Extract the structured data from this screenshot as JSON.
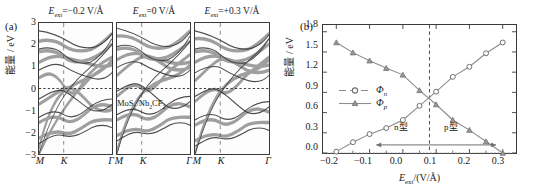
{
  "figure": {
    "panel_a_tag": "(a)",
    "panel_b_tag": "(b)"
  },
  "panel_a": {
    "ylabel": "能量 / eV",
    "yticks": [
      "3",
      "2",
      "1",
      "0",
      "−1",
      "−2",
      "−3"
    ],
    "ytick_values": [
      3,
      2,
      1,
      0,
      -1,
      -2,
      -3
    ],
    "ylim": [
      -3,
      3
    ],
    "kpath": [
      "M",
      "K",
      "Γ"
    ],
    "material_label": "MoS₂/Nb₂CF₂",
    "subpanels": [
      {
        "title": "E_ext=−0.2 V/Å",
        "field": -0.2
      },
      {
        "title": "E_ext=0 V/Å",
        "field": 0
      },
      {
        "title": "E_ext=+0.3 V/Å",
        "field": 0.3
      }
    ]
  },
  "chart_data": {
    "type": "line",
    "title": "",
    "xlabel": "E_ext/(V/Å)",
    "ylabel": "能量 / eV",
    "xlim": [
      -0.24,
      0.34
    ],
    "ylim": [
      0.0,
      1.9
    ],
    "xticks": [
      -0.2,
      -0.1,
      0.0,
      0.1,
      0.2,
      0.3
    ],
    "xtick_labels": [
      "−0.2",
      "−0.1",
      "0.0",
      "0.1",
      "0.2",
      "0.3"
    ],
    "yticks": [
      0.0,
      0.3,
      0.6,
      0.9,
      1.2,
      1.5,
      1.8
    ],
    "ytick_labels": [
      "0.0",
      "0.3",
      "0.6",
      "0.9",
      "1.2",
      "1.5",
      "1.8"
    ],
    "grid": false,
    "legend_position": "center-left",
    "x": [
      -0.2,
      -0.15,
      -0.1,
      -0.05,
      0.0,
      0.05,
      0.1,
      0.15,
      0.2,
      0.25,
      0.3
    ],
    "series": [
      {
        "name": "Φn",
        "marker": "circle",
        "values": [
          0.02,
          0.16,
          0.28,
          0.37,
          0.49,
          0.7,
          0.91,
          1.13,
          1.28,
          1.48,
          1.64
        ]
      },
      {
        "name": "Φp",
        "marker": "triangle",
        "values": [
          1.64,
          1.49,
          1.37,
          1.26,
          1.16,
          0.93,
          0.72,
          0.49,
          0.34,
          0.17,
          0.0
        ]
      }
    ],
    "annotations": [
      {
        "text": "n型",
        "arrow": "left",
        "x_range": [
          -0.08,
          0.08
        ]
      },
      {
        "text": "p型",
        "arrow": "right",
        "x_range": [
          0.08,
          0.28
        ]
      }
    ],
    "crossing_point": {
      "x": 0.08,
      "y": 0.82
    },
    "vline_x": 0.08,
    "hline_y": 0.0,
    "colors": {
      "line": "#8c8c8c",
      "marker_edge": "#6e6e6e",
      "axis": "#3a3a3a",
      "dashed": "#4a4a4a"
    }
  }
}
